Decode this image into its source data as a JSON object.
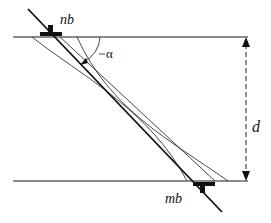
{
  "diagram": {
    "labels": {
      "top_dislocation": "nb",
      "bottom_dislocation": "mb",
      "angle": "α",
      "thickness": "d"
    },
    "colors": {
      "line": "#1a1a1a",
      "background": "#ffffff"
    },
    "elements": {
      "top_boundary": "horizontal line",
      "bottom_boundary": "horizontal line",
      "inclined_dislocation": "thick straight line",
      "curved_lines": 2,
      "dimension_arrow": "dashed double arrow"
    }
  }
}
